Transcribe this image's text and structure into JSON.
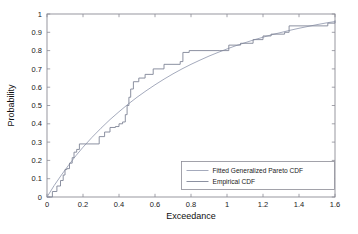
{
  "figure": {
    "background": "#ffffff",
    "axes_color": "#8c8c96",
    "text_color": "#1a1a1a"
  },
  "chart_data": {
    "type": "line",
    "title": "",
    "xlabel": "Exceedance",
    "ylabel": "Probability",
    "xlim": [
      0,
      1.6
    ],
    "ylim": [
      0,
      1
    ],
    "xticks": [
      0,
      0.2,
      0.4,
      0.6,
      0.8,
      1,
      1.2,
      1.4,
      1.6
    ],
    "xtick_labels": [
      "0",
      "0.2",
      "0.4",
      "0.6",
      "0.8",
      "1",
      "1.2",
      "1.4",
      "1.6"
    ],
    "yticks": [
      0,
      0.1,
      0.2,
      0.3,
      0.4,
      0.5,
      0.6,
      0.7,
      0.8,
      0.9,
      1
    ],
    "ytick_labels": [
      "0",
      "0.1",
      "0.2",
      "0.3",
      "0.4",
      "0.5",
      "0.6",
      "0.7",
      "0.8",
      "0.9",
      "1"
    ],
    "grid": false,
    "legend_position": "lower right",
    "series": [
      {
        "name": "Fitted Generalized Pareto CDF",
        "color": "#9aa0b4",
        "style": "smooth",
        "x": [
          0.0,
          0.04,
          0.08,
          0.12,
          0.16,
          0.2,
          0.25,
          0.3,
          0.35,
          0.4,
          0.45,
          0.5,
          0.55,
          0.6,
          0.65,
          0.7,
          0.75,
          0.8,
          0.85,
          0.9,
          0.95,
          1.0,
          1.05,
          1.1,
          1.15,
          1.2,
          1.25,
          1.3,
          1.35,
          1.4,
          1.45,
          1.5,
          1.55,
          1.6
        ],
        "y": [
          0.0,
          0.063,
          0.12,
          0.174,
          0.225,
          0.272,
          0.326,
          0.376,
          0.423,
          0.466,
          0.507,
          0.545,
          0.58,
          0.613,
          0.644,
          0.673,
          0.7,
          0.725,
          0.748,
          0.77,
          0.79,
          0.809,
          0.827,
          0.843,
          0.859,
          0.873,
          0.887,
          0.899,
          0.911,
          0.922,
          0.932,
          0.942,
          0.951,
          0.959
        ]
      },
      {
        "name": "Empirical CDF",
        "color": "#7f8596",
        "style": "step",
        "x": [
          0.0,
          0.03,
          0.055,
          0.075,
          0.09,
          0.1,
          0.11,
          0.125,
          0.14,
          0.15,
          0.165,
          0.18,
          0.215,
          0.29,
          0.32,
          0.35,
          0.38,
          0.4,
          0.42,
          0.435,
          0.445,
          0.455,
          0.465,
          0.48,
          0.51,
          0.545,
          0.59,
          0.65,
          0.74,
          0.755,
          0.79,
          0.96,
          1.01,
          1.075,
          1.145,
          1.2,
          1.245,
          1.32,
          1.345,
          1.56,
          1.6
        ],
        "y": [
          0.0,
          0.03,
          0.06,
          0.09,
          0.12,
          0.15,
          0.155,
          0.185,
          0.215,
          0.245,
          0.26,
          0.29,
          0.29,
          0.33,
          0.355,
          0.38,
          0.385,
          0.4,
          0.41,
          0.45,
          0.5,
          0.545,
          0.59,
          0.63,
          0.65,
          0.67,
          0.7,
          0.725,
          0.74,
          0.79,
          0.8,
          0.8,
          0.83,
          0.84,
          0.86,
          0.88,
          0.89,
          0.9,
          0.935,
          0.95,
          0.965
        ]
      }
    ]
  },
  "legend": {
    "entries": [
      {
        "label": "Fitted Generalized Pareto CDF"
      },
      {
        "label": "Empirical CDF"
      }
    ]
  }
}
